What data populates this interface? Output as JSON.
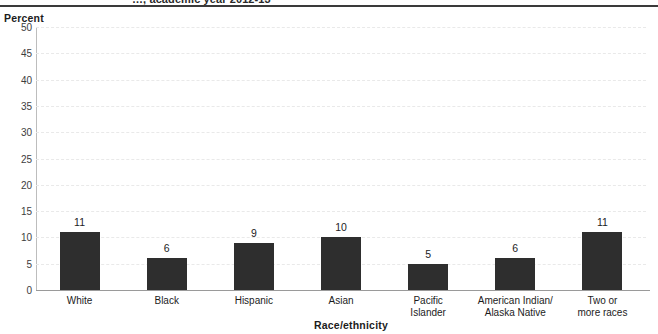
{
  "header": {
    "clipped_title": "…, academic year 2012-13"
  },
  "chart_data": {
    "type": "bar",
    "title": "",
    "categories": [
      "White",
      "Black",
      "Hispanic",
      "Asian",
      "Pacific\nIslander",
      "American Indian/\nAlaska Native",
      "Two or\nmore races"
    ],
    "values": [
      11,
      6,
      9,
      10,
      5,
      6,
      11
    ],
    "data_labels": [
      "11",
      "6",
      "9",
      "10",
      "5",
      "6",
      "11"
    ],
    "xlabel": "Race/ethnicity",
    "ylabel": "Percent",
    "ylim": [
      0,
      50
    ],
    "yticks": [
      50,
      45,
      40,
      35,
      30,
      25,
      20,
      15,
      10,
      5,
      0
    ],
    "ytick_labels": [
      "50",
      "45",
      "40",
      "35",
      "30",
      "25",
      "20",
      "15",
      "10",
      "5",
      "0"
    ],
    "grid": true,
    "grid_axis": "y",
    "legend": "none",
    "bar_color": "#2e2e2e",
    "grid_color": "#e9e9e9",
    "axis_color": "#9a9a9a"
  }
}
